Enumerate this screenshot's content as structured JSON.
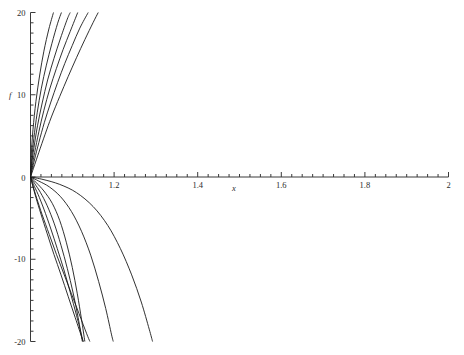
{
  "chart_data": {
    "type": "line",
    "title": "",
    "xlabel": "x",
    "ylabel": "f",
    "xlim": [
      1,
      2
    ],
    "ylim": [
      -20,
      20
    ],
    "grid": false,
    "legend": null,
    "x_ticks_major": [
      "1.2",
      "1.4",
      "1.6",
      "1.8",
      "2"
    ],
    "x_tick_major_values": [
      1.2,
      1.4,
      1.6,
      1.8,
      2.0
    ],
    "x_minor_tick_step": 0.025,
    "y_ticks_major": [
      "20",
      "10",
      "0",
      "-10",
      "-20"
    ],
    "y_tick_major_values": [
      20,
      10,
      0,
      -10,
      -20
    ],
    "y_minor_tick_step": 1.25,
    "origin_label": "0",
    "axis_color": "#3a3a3a",
    "curve_color": "#1a1a1a",
    "background": "#ffffff",
    "series": [
      {
        "name": "upper-1",
        "points": [
          [
            1,
            0
          ],
          [
            1.004,
            0.6
          ],
          [
            1.01,
            1.5
          ],
          [
            1.02,
            3.0
          ],
          [
            1.035,
            5.2
          ],
          [
            1.05,
            7.3
          ],
          [
            1.07,
            9.8
          ],
          [
            1.09,
            12.2
          ],
          [
            1.11,
            14.5
          ],
          [
            1.13,
            16.7
          ],
          [
            1.15,
            18.8
          ],
          [
            1.162,
            20
          ]
        ]
      },
      {
        "name": "upper-2",
        "points": [
          [
            1,
            0
          ],
          [
            1.004,
            0.9
          ],
          [
            1.01,
            2.2
          ],
          [
            1.02,
            4.2
          ],
          [
            1.033,
            6.6
          ],
          [
            1.048,
            9.0
          ],
          [
            1.065,
            11.5
          ],
          [
            1.082,
            13.8
          ],
          [
            1.1,
            16.0
          ],
          [
            1.118,
            18.1
          ],
          [
            1.138,
            20
          ]
        ]
      },
      {
        "name": "upper-3",
        "points": [
          [
            1,
            0
          ],
          [
            1.004,
            1.3
          ],
          [
            1.01,
            3.0
          ],
          [
            1.02,
            5.5
          ],
          [
            1.032,
            8.1
          ],
          [
            1.046,
            10.7
          ],
          [
            1.062,
            13.2
          ],
          [
            1.078,
            15.5
          ],
          [
            1.095,
            17.7
          ],
          [
            1.113,
            20
          ]
        ]
      },
      {
        "name": "upper-4",
        "points": [
          [
            1,
            0
          ],
          [
            1.003,
            1.6
          ],
          [
            1.008,
            3.5
          ],
          [
            1.017,
            6.3
          ],
          [
            1.028,
            9.0
          ],
          [
            1.041,
            11.8
          ],
          [
            1.056,
            14.4
          ],
          [
            1.072,
            16.9
          ],
          [
            1.088,
            19.2
          ],
          [
            1.095,
            20
          ]
        ]
      },
      {
        "name": "upper-5",
        "points": [
          [
            1,
            0
          ],
          [
            1.003,
            2.2
          ],
          [
            1.008,
            4.7
          ],
          [
            1.016,
            7.8
          ],
          [
            1.026,
            10.8
          ],
          [
            1.038,
            13.6
          ],
          [
            1.051,
            16.2
          ],
          [
            1.065,
            18.7
          ],
          [
            1.074,
            20
          ]
        ]
      },
      {
        "name": "upper-6",
        "points": [
          [
            1,
            0
          ],
          [
            1.002,
            2.8
          ],
          [
            1.006,
            5.8
          ],
          [
            1.013,
            9.2
          ],
          [
            1.022,
            12.4
          ],
          [
            1.032,
            15.3
          ],
          [
            1.044,
            18.0
          ],
          [
            1.055,
            20
          ]
        ]
      },
      {
        "name": "lower-1",
        "points": [
          [
            1,
            0
          ],
          [
            1.006,
            -1.1
          ],
          [
            1.015,
            -2.6
          ],
          [
            1.028,
            -4.6
          ],
          [
            1.045,
            -7.0
          ],
          [
            1.062,
            -9.4
          ],
          [
            1.08,
            -11.8
          ],
          [
            1.098,
            -14.2
          ],
          [
            1.116,
            -16.6
          ],
          [
            1.134,
            -19.0
          ],
          [
            1.142,
            -20
          ]
        ]
      },
      {
        "name": "lower-2",
        "points": [
          [
            1,
            0
          ],
          [
            1.005,
            -1.0
          ],
          [
            1.013,
            -2.5
          ],
          [
            1.025,
            -4.5
          ],
          [
            1.04,
            -6.9
          ],
          [
            1.056,
            -9.4
          ],
          [
            1.073,
            -11.9
          ],
          [
            1.09,
            -14.5
          ],
          [
            1.107,
            -17.1
          ],
          [
            1.124,
            -19.7
          ],
          [
            1.126,
            -20
          ]
        ]
      },
      {
        "name": "lower-3",
        "points": [
          [
            1,
            0
          ],
          [
            1.007,
            -0.9
          ],
          [
            1.018,
            -2.1
          ],
          [
            1.032,
            -3.9
          ],
          [
            1.048,
            -6.2
          ],
          [
            1.064,
            -8.7
          ],
          [
            1.08,
            -11.3
          ],
          [
            1.095,
            -14.0
          ],
          [
            1.11,
            -16.8
          ],
          [
            1.124,
            -19.6
          ],
          [
            1.126,
            -20
          ]
        ]
      },
      {
        "name": "lower-4",
        "points": [
          [
            1,
            0
          ],
          [
            1.01,
            -0.8
          ],
          [
            1.024,
            -1.9
          ],
          [
            1.04,
            -3.5
          ],
          [
            1.057,
            -5.7
          ],
          [
            1.073,
            -8.3
          ],
          [
            1.088,
            -11.1
          ],
          [
            1.102,
            -14.1
          ],
          [
            1.114,
            -17.1
          ],
          [
            1.124,
            -20
          ]
        ]
      },
      {
        "name": "lower-5",
        "points": [
          [
            1,
            0
          ],
          [
            1.014,
            -0.7
          ],
          [
            1.032,
            -1.7
          ],
          [
            1.052,
            -3.2
          ],
          [
            1.07,
            -5.3
          ],
          [
            1.086,
            -8.0
          ],
          [
            1.1,
            -11.0
          ],
          [
            1.112,
            -14.2
          ],
          [
            1.122,
            -17.3
          ],
          [
            1.13,
            -20
          ]
        ]
      },
      {
        "name": "lower-6",
        "points": [
          [
            1,
            0
          ],
          [
            1.02,
            -0.5
          ],
          [
            1.045,
            -1.2
          ],
          [
            1.072,
            -2.4
          ],
          [
            1.098,
            -4.2
          ],
          [
            1.122,
            -6.6
          ],
          [
            1.144,
            -9.5
          ],
          [
            1.163,
            -12.7
          ],
          [
            1.18,
            -16.0
          ],
          [
            1.194,
            -19.2
          ],
          [
            1.198,
            -20
          ]
        ]
      },
      {
        "name": "lower-7",
        "points": [
          [
            1,
            0
          ],
          [
            1.03,
            -0.3
          ],
          [
            1.07,
            -0.9
          ],
          [
            1.11,
            -1.9
          ],
          [
            1.15,
            -3.6
          ],
          [
            1.185,
            -5.9
          ],
          [
            1.215,
            -8.7
          ],
          [
            1.242,
            -11.9
          ],
          [
            1.265,
            -15.2
          ],
          [
            1.284,
            -18.5
          ],
          [
            1.292,
            -20
          ]
        ]
      }
    ]
  }
}
